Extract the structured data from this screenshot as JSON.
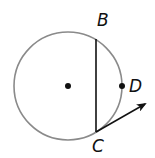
{
  "diagram": {
    "labels": {
      "B": "B",
      "C": "C",
      "D": "D"
    },
    "colors": {
      "circle": "#8a8a8a",
      "ink": "#111111"
    }
  }
}
